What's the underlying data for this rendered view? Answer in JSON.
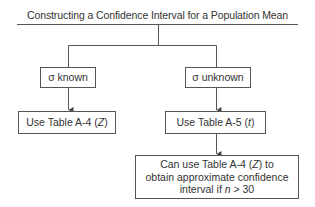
{
  "diagram": {
    "title": "Constructing a Confidence Interval for a Population Mean",
    "nodes": {
      "sigma_known": {
        "label": "σ known"
      },
      "sigma_unknown": {
        "label": "σ unknown"
      },
      "use_table_a4": {
        "prefix": "Use Table A-4 (",
        "var": "Z",
        "suffix": ")"
      },
      "use_table_a5": {
        "prefix": "Use Table A-5 (",
        "var": "t",
        "suffix": ")"
      },
      "approx_note": {
        "line1_prefix": "Can use Table A-4 (",
        "line1_var": "Z",
        "line1_suffix": ") to",
        "line2": "obtain approximate confidence",
        "line3_prefix": "interval if ",
        "line3_var": "n",
        "line3_suffix": " > 30"
      }
    },
    "edges": [
      {
        "from": "title",
        "to": "sigma_known"
      },
      {
        "from": "title",
        "to": "sigma_unknown"
      },
      {
        "from": "sigma_known",
        "to": "use_table_a4"
      },
      {
        "from": "sigma_unknown",
        "to": "use_table_a5"
      },
      {
        "from": "use_table_a5",
        "to": "approx_note"
      }
    ],
    "colors": {
      "line": "#555555",
      "text": "#333333",
      "background": "#ffffff"
    }
  }
}
